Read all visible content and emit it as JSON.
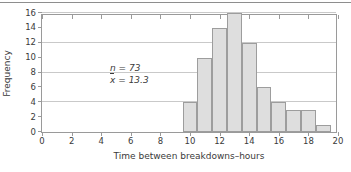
{
  "chart_data": {
    "type": "bar",
    "title": "",
    "xlabel": "Time between breakdowns–hours",
    "ylabel": "Frequency",
    "xlim": [
      0,
      20
    ],
    "ylim": [
      0,
      16
    ],
    "xticks": [
      0,
      2,
      4,
      6,
      8,
      10,
      12,
      14,
      16,
      18,
      20
    ],
    "yticks": [
      0,
      2,
      4,
      6,
      8,
      10,
      12,
      14,
      16
    ],
    "gridlines_y": [
      4,
      8,
      12,
      16
    ],
    "grid": true,
    "legend": "none",
    "bin_width": 1,
    "bins": [
      {
        "left": 9.5,
        "right": 10.5,
        "value": 4
      },
      {
        "left": 10.5,
        "right": 11.5,
        "value": 10
      },
      {
        "left": 11.5,
        "right": 12.5,
        "value": 14
      },
      {
        "left": 12.5,
        "right": 13.5,
        "value": 16
      },
      {
        "left": 13.5,
        "right": 14.5,
        "value": 12
      },
      {
        "left": 14.5,
        "right": 15.5,
        "value": 6
      },
      {
        "left": 15.5,
        "right": 16.5,
        "value": 4
      },
      {
        "left": 16.5,
        "right": 17.5,
        "value": 3
      },
      {
        "left": 17.5,
        "right": 18.5,
        "value": 3
      },
      {
        "left": 18.5,
        "right": 19.5,
        "value": 1
      }
    ],
    "bar_fill": "#dedede",
    "bar_border": "#9d9d9d",
    "annotations": [
      {
        "symbol": "n",
        "eq": "=",
        "value": "73"
      },
      {
        "symbol": "x",
        "bar": true,
        "eq": "=",
        "value": "13.3"
      }
    ]
  },
  "annotation": {
    "n_symbol": "n",
    "n_eq": "=",
    "n_value": "73",
    "mean_symbol": "x",
    "mean_eq": "=",
    "mean_value": "13.3"
  }
}
